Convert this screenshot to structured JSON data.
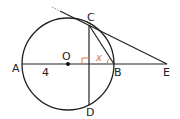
{
  "diagram": {
    "type": "geometry",
    "points": {
      "A": {
        "label": "A",
        "x": 22,
        "y": 64
      },
      "O": {
        "label": "O",
        "x": 68,
        "y": 64
      },
      "B": {
        "label": "B",
        "x": 114,
        "y": 64
      },
      "E": {
        "label": "E",
        "x": 167,
        "y": 64
      },
      "C": {
        "label": "C",
        "x": 89,
        "y": 25
      },
      "D": {
        "label": "D",
        "x": 89,
        "y": 107
      }
    },
    "circle": {
      "center": "O",
      "radius": 46
    },
    "segments": [
      {
        "from": "A",
        "to": "E",
        "name": "line-AE"
      },
      {
        "from": "C",
        "to": "D",
        "name": "chord-CD"
      },
      {
        "from": "C",
        "to": "B",
        "name": "chord-CB"
      },
      {
        "from": "tangent-start",
        "to": "E",
        "name": "tangent-CE"
      }
    ],
    "labels": {
      "length_AO": "4",
      "angle": "x"
    },
    "colors": {
      "stroke": "#222222",
      "accent": "#e07a50",
      "dashed_extension": "#888888"
    }
  }
}
